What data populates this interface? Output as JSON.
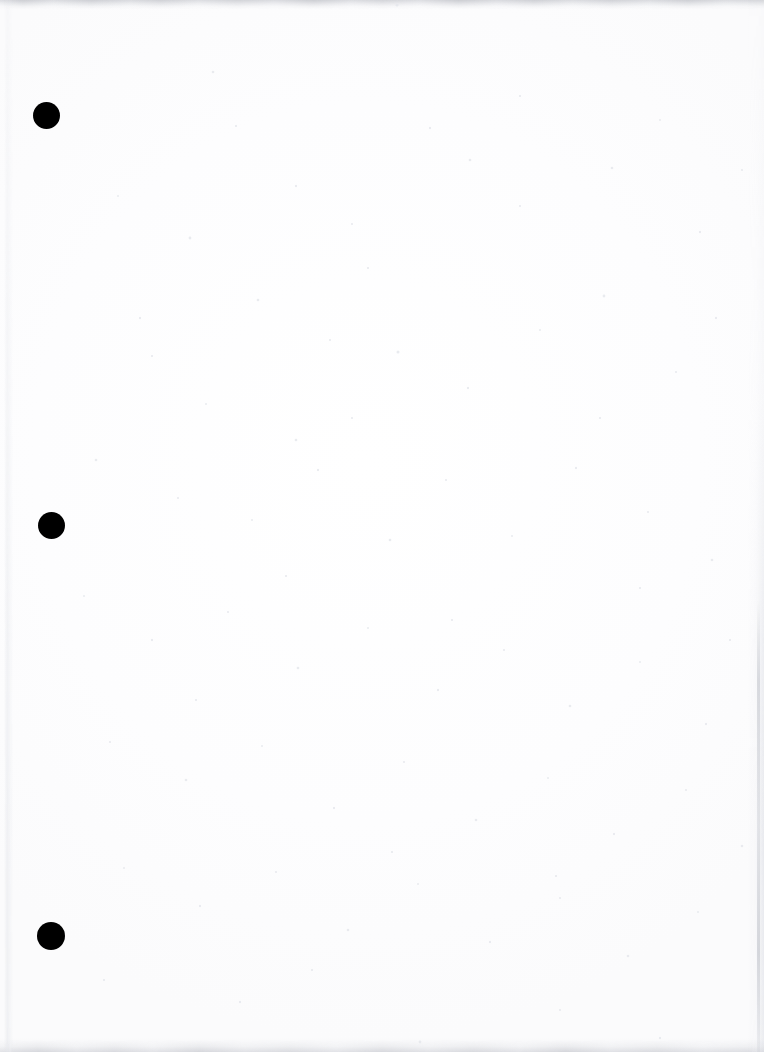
{
  "document": {
    "title": "Scanned Blank Page",
    "page_width": 764,
    "page_height": 1052,
    "paper_color": "#fdfdfe",
    "ink_color": "#000000",
    "content_text": "",
    "description": "Blank scanned sheet of paper with three solid black binding-hole marks along the left margin and faint gray scanner shading at the page edges."
  },
  "marks": {
    "type": "binding-holes",
    "count": 3,
    "color": "#000000",
    "shape": "circle",
    "items": [
      {
        "label": "hole-1",
        "cx": 46,
        "cy": 115,
        "d": 27
      },
      {
        "label": "hole-2",
        "cx": 51,
        "cy": 525,
        "d": 27
      },
      {
        "label": "hole-3",
        "cx": 51,
        "cy": 936,
        "d": 28
      }
    ]
  },
  "edges": {
    "top_band_color": "#c4c6cd",
    "bottom_band_color": "#cdcfd5",
    "left_line_color": "#e4e6eb",
    "right_band_color": "#dddfe5",
    "right_streak_color": "#babdc5"
  },
  "speckle": {
    "color": "#e8eaee",
    "note": "scattered faint scanner dust across the sheet"
  }
}
